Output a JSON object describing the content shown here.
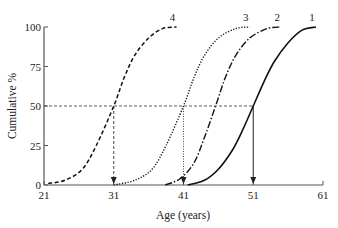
{
  "chart_data": {
    "type": "line",
    "title": "",
    "xlabel": "Age (years)",
    "ylabel": "Cumulative %",
    "xlim": [
      21,
      61
    ],
    "ylim": [
      0,
      100
    ],
    "x_ticks": [
      21,
      31,
      41,
      51,
      61
    ],
    "y_ticks": [
      0,
      25,
      50,
      75,
      100
    ],
    "grid": false,
    "legend": "inline labels at curve tops",
    "series": [
      {
        "name": "1",
        "style": "solid",
        "x50": 51,
        "x_start": 41.6,
        "x_end": 60,
        "points": [
          [
            41.6,
            0
          ],
          [
            44,
            3
          ],
          [
            46,
            10
          ],
          [
            48,
            22
          ],
          [
            49.5,
            35
          ],
          [
            51,
            50
          ],
          [
            52.5,
            65
          ],
          [
            54,
            78
          ],
          [
            56,
            90
          ],
          [
            58,
            98
          ],
          [
            60,
            100
          ]
        ]
      },
      {
        "name": "2",
        "style": "dash-dot",
        "x50": 45.6,
        "x_start": 38.4,
        "x_end": 55,
        "points": [
          [
            38.4,
            0
          ],
          [
            40.5,
            4
          ],
          [
            42.5,
            14
          ],
          [
            44,
            30
          ],
          [
            45.6,
            50
          ],
          [
            47,
            68
          ],
          [
            48.5,
            82
          ],
          [
            50.5,
            93
          ],
          [
            53,
            99
          ],
          [
            55,
            100
          ]
        ]
      },
      {
        "name": "3",
        "style": "dotted",
        "x50": 41,
        "x_start": 31,
        "x_end": 50.5,
        "points": [
          [
            31,
            0
          ],
          [
            34,
            3
          ],
          [
            36.5,
            10
          ],
          [
            38.5,
            25
          ],
          [
            41,
            50
          ],
          [
            42.5,
            68
          ],
          [
            44,
            82
          ],
          [
            46,
            93
          ],
          [
            48.5,
            99
          ],
          [
            50.5,
            100
          ]
        ]
      },
      {
        "name": "4",
        "style": "dashed",
        "x50": 31,
        "x_start": 21.6,
        "x_end": 40,
        "points": [
          [
            21.6,
            1
          ],
          [
            24,
            3
          ],
          [
            26.5,
            10
          ],
          [
            28.5,
            25
          ],
          [
            31,
            50
          ],
          [
            32.5,
            68
          ],
          [
            34,
            82
          ],
          [
            36,
            93
          ],
          [
            38,
            99
          ],
          [
            40,
            100
          ]
        ]
      }
    ],
    "annotations": {
      "median_line_y": 50,
      "median_drop_lines": [
        {
          "series": "4",
          "x": 31,
          "style": "dashed"
        },
        {
          "series": "3",
          "x": 41,
          "style": "dotted"
        },
        {
          "series": "1",
          "x": 51,
          "style": "solid"
        }
      ]
    }
  }
}
